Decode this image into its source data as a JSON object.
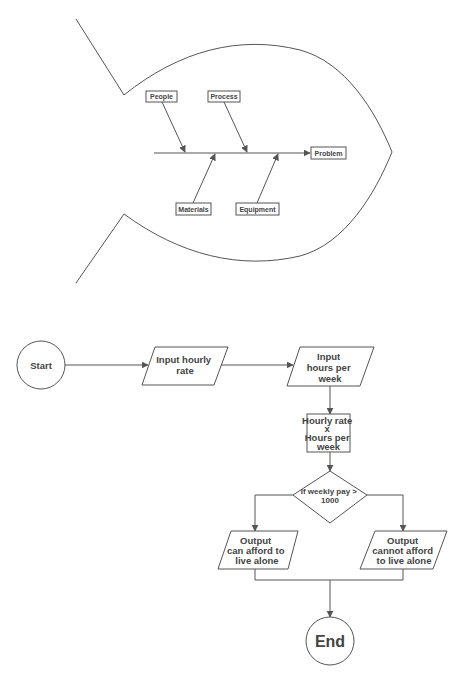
{
  "fishbone": {
    "effect": "Problem",
    "causes": {
      "top": [
        "People",
        "Process"
      ],
      "bottom": [
        "Materials",
        "Equipment"
      ]
    }
  },
  "flowchart": {
    "start": "Start",
    "input1": [
      "Input hourly",
      "rate"
    ],
    "input2": [
      "Input",
      "hours per",
      "week"
    ],
    "process": [
      "Hourly rate",
      "x",
      "Hours per",
      "week"
    ],
    "decision": [
      "If weekly pay >",
      "1000"
    ],
    "output_yes": [
      "Output",
      "can afford to",
      "live alone"
    ],
    "output_no": [
      "Output",
      "cannot afford",
      "to live alone"
    ],
    "end": "End"
  },
  "colors": {
    "stroke": "#555555",
    "text": "#444444",
    "background": "#ffffff"
  }
}
